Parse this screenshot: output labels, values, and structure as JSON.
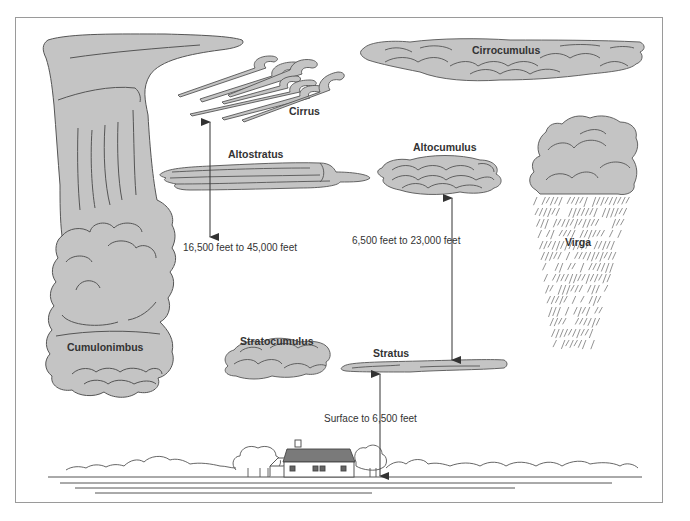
{
  "diagram": {
    "title": "",
    "colors": {
      "cloud_fill": "#c4c4c4",
      "cloud_stroke": "#555555",
      "frame_stroke": "#9a9a9a",
      "arrow": "#333333",
      "roof": "#7a7a7a",
      "background": "#ffffff"
    },
    "clouds": [
      {
        "id": "cumulonimbus",
        "label": "Cumulonimbus"
      },
      {
        "id": "cirrus",
        "label": "Cirrus"
      },
      {
        "id": "cirrocumulus",
        "label": "Cirrocumulus"
      },
      {
        "id": "altostratus",
        "label": "Altostratus"
      },
      {
        "id": "altocumulus",
        "label": "Altocumulus"
      },
      {
        "id": "virga",
        "label": "Virga"
      },
      {
        "id": "stratocumulus",
        "label": "Stratocumulus"
      },
      {
        "id": "stratus",
        "label": "Stratus"
      }
    ],
    "altitude_ranges": [
      {
        "id": "high",
        "label": "16,500 feet to 45,000 feet"
      },
      {
        "id": "middle",
        "label": "6,500 feet to 23,000 feet"
      },
      {
        "id": "low",
        "label": "Surface to 6,500 feet"
      }
    ],
    "ground": {
      "elements": [
        "house-icon",
        "tree-line",
        "ground-lines"
      ]
    }
  }
}
